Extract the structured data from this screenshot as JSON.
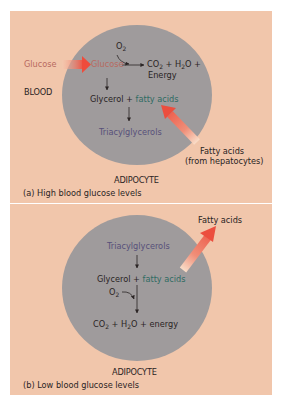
{
  "colors": {
    "background": "#f1c6ab",
    "cell": "#9f9b9c",
    "glucose_text": "#b86a5f",
    "fatty_acids_text": "#2f6b63",
    "triacylglycerols_text": "#57507a",
    "transport_arrow": "#ee5a4a"
  },
  "panel_a": {
    "caption": "(a) High blood glucose levels",
    "cell_label": "ADIPOCYTE",
    "blood_label": "BLOOD",
    "glucose_outside": "Glucose",
    "glucose_inside": "Glucose",
    "oxygen": "O",
    "oxygen_sub": "2",
    "products": {
      "co2": "CO",
      "co2_sub": "2",
      "plus1": " + H",
      "h2o_sub": "2",
      "h2o_tail": "O +",
      "energy": "Energy"
    },
    "glycerol": "Glycerol + ",
    "fatty_acids": "fatty acids",
    "triacylglycerols": "Triacylglycerols",
    "external_fatty_acids": "Fatty acids",
    "external_source": "(from hepatocytes)"
  },
  "panel_b": {
    "caption": "(b) Low blood glucose levels",
    "cell_label": "ADIPOCYTE",
    "triacylglycerols": "Triacylglycerols",
    "glycerol": "Glycerol + ",
    "fatty_acids": "fatty acids",
    "oxygen": "O",
    "oxygen_sub": "2",
    "products": {
      "co2": "CO",
      "co2_sub": "2",
      "plus1": " + H",
      "h2o_sub": "2",
      "h2o_tail": "O + energy"
    },
    "released_fatty_acids": "Fatty acids"
  }
}
